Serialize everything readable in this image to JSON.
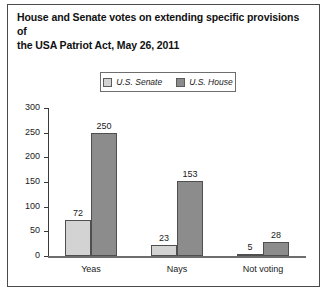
{
  "chart_data": {
    "type": "bar",
    "title": "House and Senate votes on extending specific provisions of the USA Patriot Act, May 26, 2011",
    "title_line1": "House and Senate votes on extending specific provisions of",
    "title_line2": "the USA Patriot Act, May 26, 2011",
    "categories": [
      "Yeas",
      "Nays",
      "Not voting"
    ],
    "series": [
      {
        "name": "U.S. Senate",
        "color": "#d3d3d3",
        "values": [
          72,
          23,
          5
        ]
      },
      {
        "name": "U.S. House",
        "color": "#8c8c8c",
        "values": [
          250,
          153,
          28
        ]
      }
    ],
    "xlabel": "",
    "ylabel": "",
    "ylim": [
      0,
      300
    ],
    "yticks": [
      0,
      50,
      100,
      150,
      200,
      250,
      300
    ],
    "ytick_labels": [
      "0",
      "50",
      "100",
      "150",
      "200",
      "250",
      "300"
    ],
    "grid": false,
    "legend_position": "top-center",
    "data_labels": true
  },
  "legend": {
    "entries": [
      {
        "label": "U.S. Senate",
        "swatch": "senate-swatch"
      },
      {
        "label": "U.S. House",
        "swatch": "house-swatch"
      }
    ]
  }
}
